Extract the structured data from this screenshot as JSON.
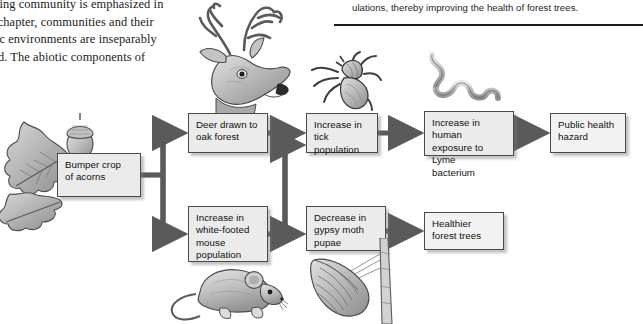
{
  "page": {
    "left_column_text": "living community is emphasized in\nis chapter, communities and their\notic environments are inseparably\nked. The abiotic components of",
    "right_column_text": "ulations, thereby improving the health of forest trees."
  },
  "flowchart": {
    "title": "Acorn crop ecological cascade",
    "nodes": [
      {
        "id": "acorns",
        "label": "Bumper crop\nof acorns"
      },
      {
        "id": "deer",
        "label": "Deer drawn to\noak forest"
      },
      {
        "id": "tick",
        "label": "Increase in\ntick population"
      },
      {
        "id": "lyme",
        "label": "Increase in human\nexposure to Lyme\nbacterium"
      },
      {
        "id": "public",
        "label": "Public health\nhazard"
      },
      {
        "id": "mouse",
        "label": "Increase in\nwhite-footed\nmouse\npopulation"
      },
      {
        "id": "gypsy",
        "label": "Decrease in\ngypsy moth\npupae"
      },
      {
        "id": "healthier",
        "label": "Healthier\nforest trees"
      }
    ],
    "edges": [
      {
        "from": "acorns",
        "to": "deer"
      },
      {
        "from": "acorns",
        "to": "mouse"
      },
      {
        "from": "deer",
        "to": "tick"
      },
      {
        "from": "mouse",
        "to": "tick"
      },
      {
        "from": "mouse",
        "to": "gypsy"
      },
      {
        "from": "tick",
        "to": "lyme"
      },
      {
        "from": "lyme",
        "to": "public"
      },
      {
        "from": "gypsy",
        "to": "healthier"
      }
    ],
    "illustrations": [
      {
        "id": "oak",
        "name": "oak-leaves-and-acorn-illustration"
      },
      {
        "id": "deer",
        "name": "deer-head-illustration"
      },
      {
        "id": "tick",
        "name": "tick-illustration"
      },
      {
        "id": "spiro",
        "name": "lyme-spirochete-bacterium-illustration"
      },
      {
        "id": "mouse",
        "name": "white-footed-mouse-illustration"
      },
      {
        "id": "pupa",
        "name": "gypsy-moth-pupa-illustration"
      }
    ]
  },
  "colors": {
    "box_fill": "#ebebeb",
    "box_border": "#4a4a4a",
    "arrow": "#5a5a5a",
    "text": "#101010",
    "background": "#ffffff",
    "rule": "#1b1d20"
  }
}
